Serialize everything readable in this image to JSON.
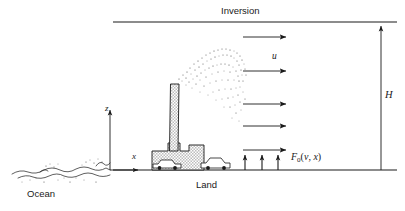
{
  "figure": {
    "type": "schematic-diagram",
    "width": 405,
    "height": 211,
    "background_color": "#ffffff",
    "line_color": "#1a1a1a",
    "fill_color": "#d4d4d4"
  },
  "labels": {
    "inversion": "Inversion",
    "ocean": "Ocean",
    "land": "Land",
    "wind_speed": "u",
    "mixing_height": "H",
    "vertical_axis": "z",
    "horizontal_axis": "x",
    "surface_flux_symbol": "F",
    "surface_flux_subscript": "0",
    "surface_flux_args_open": "(",
    "surface_flux_arg1": "v",
    "surface_flux_comma": ", ",
    "surface_flux_arg2": "x",
    "surface_flux_args_close": ")",
    "surface_flux_full": "F0(v, x)"
  },
  "elements": {
    "inversion_line": {
      "x1": 113,
      "y1": 22,
      "x2": 397,
      "y2": 22
    },
    "ground_line": {
      "x1": 113,
      "y1": 170,
      "x2": 397,
      "y2": 170
    },
    "height_arrow": {
      "x": 381,
      "y_top": 24,
      "y_bottom": 170,
      "label": "H"
    },
    "z_axis": {
      "x": 110,
      "y_top": 106,
      "y_bottom": 170
    },
    "x_axis": {
      "y": 170,
      "x_start": 110,
      "x_end": 142
    },
    "wind_arrows": [
      {
        "y": 37,
        "x1": 243,
        "x2": 288
      },
      {
        "y": 71,
        "x1": 243,
        "x2": 288
      },
      {
        "y": 104,
        "x1": 243,
        "x2": 288
      },
      {
        "y": 126,
        "x1": 243,
        "x2": 288
      },
      {
        "y": 150,
        "x1": 243,
        "x2": 288
      }
    ],
    "flux_arrows": [
      {
        "x": 245,
        "y_bottom": 170,
        "y_top": 152
      },
      {
        "x": 262,
        "y_bottom": 170,
        "y_top": 152
      },
      {
        "x": 278,
        "y_bottom": 170,
        "y_top": 152
      }
    ],
    "chimney": {
      "x": 170,
      "y_top": 84,
      "width": 10,
      "y_bottom": 146
    },
    "factory": {
      "x": 152,
      "y_top": 146,
      "width": 52,
      "y_bottom": 170
    },
    "cars": [
      {
        "x": 152,
        "y": 163
      },
      {
        "x": 200,
        "y": 161
      }
    ],
    "plume": {
      "origin_x": 176,
      "origin_y": 84,
      "direction": "up-right arc",
      "style": "stippled dots"
    }
  }
}
